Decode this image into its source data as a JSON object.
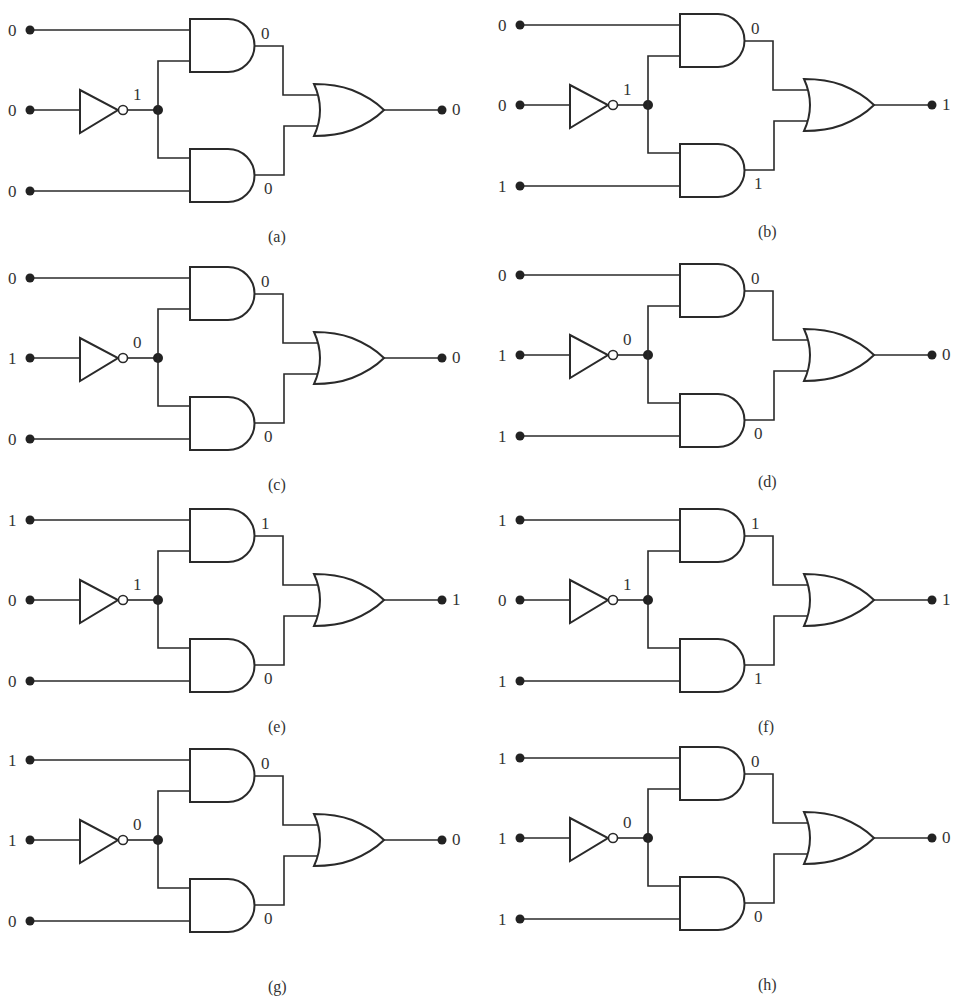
{
  "figure": {
    "colors": {
      "ink": "#2a2a2a",
      "background": "#ffffff"
    },
    "panels": [
      {
        "id": "a",
        "caption": "(a)",
        "inputs": {
          "a": "0",
          "b": "0",
          "c": "0"
        },
        "not_out": "1",
        "and_top": "0",
        "and_bottom": "0",
        "output": "0"
      },
      {
        "id": "b",
        "caption": "(b)",
        "inputs": {
          "a": "0",
          "b": "0",
          "c": "1"
        },
        "not_out": "1",
        "and_top": "0",
        "and_bottom": "1",
        "output": "1"
      },
      {
        "id": "c",
        "caption": "(c)",
        "inputs": {
          "a": "0",
          "b": "1",
          "c": "0"
        },
        "not_out": "0",
        "and_top": "0",
        "and_bottom": "0",
        "output": "0"
      },
      {
        "id": "d",
        "caption": "(d)",
        "inputs": {
          "a": "0",
          "b": "1",
          "c": "1"
        },
        "not_out": "0",
        "and_top": "0",
        "and_bottom": "0",
        "output": "0"
      },
      {
        "id": "e",
        "caption": "(e)",
        "inputs": {
          "a": "1",
          "b": "0",
          "c": "0"
        },
        "not_out": "1",
        "and_top": "1",
        "and_bottom": "0",
        "output": "1"
      },
      {
        "id": "f",
        "caption": "(f)",
        "inputs": {
          "a": "1",
          "b": "0",
          "c": "1"
        },
        "not_out": "1",
        "and_top": "1",
        "and_bottom": "1",
        "output": "1"
      },
      {
        "id": "g",
        "caption": "(g)",
        "inputs": {
          "a": "1",
          "b": "1",
          "c": "0"
        },
        "not_out": "0",
        "and_top": "0",
        "and_bottom": "0",
        "output": "0"
      },
      {
        "id": "h",
        "caption": "(h)",
        "inputs": {
          "a": "1",
          "b": "1",
          "c": "1"
        },
        "not_out": "0",
        "and_top": "0",
        "and_bottom": "0",
        "output": "0"
      }
    ],
    "gate_types": {
      "inverter": "NOT",
      "top_gate": "AND",
      "bottom_gate": "AND",
      "output_gate": "OR"
    }
  }
}
